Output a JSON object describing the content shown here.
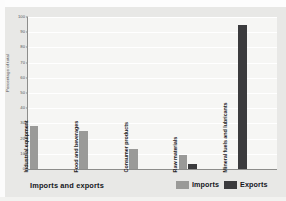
{
  "chart_data": {
    "type": "bar",
    "title": "",
    "xlabel": "Imports and exports",
    "ylabel": "Percentage of total",
    "ylim": [
      0,
      100
    ],
    "yticks": [
      0,
      10,
      20,
      30,
      40,
      50,
      60,
      70,
      80,
      90,
      100
    ],
    "grid": true,
    "legend_position": "bottom-right",
    "categories": [
      "Industrial equipment",
      "Food and beverages",
      "Consumer products",
      "Raw materials",
      "Mineral fuels and lubricants"
    ],
    "series": [
      {
        "name": "Imports",
        "color": "#9a9a98",
        "values": [
          28,
          25,
          13,
          9,
          0
        ]
      },
      {
        "name": "Exports",
        "color": "#3b3b3d",
        "values": [
          0,
          0,
          0,
          3,
          95
        ]
      }
    ]
  },
  "legend": {
    "items": [
      {
        "label": "Imports",
        "color": "#9a9a98"
      },
      {
        "label": "Exports",
        "color": "#3b3b3d"
      }
    ]
  }
}
